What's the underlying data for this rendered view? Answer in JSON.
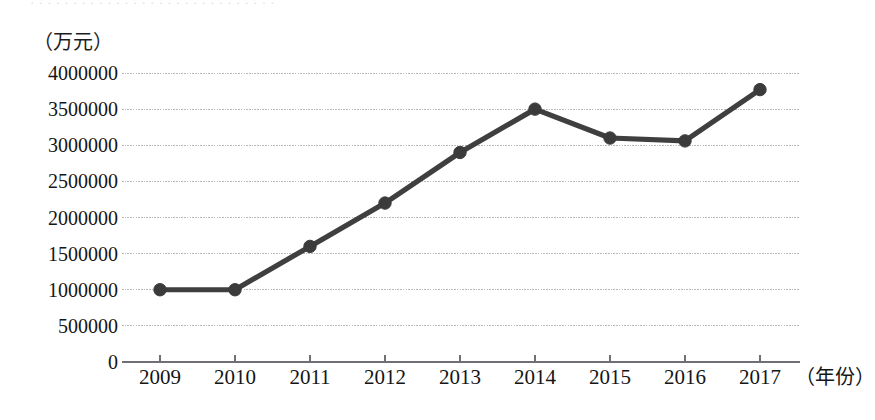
{
  "chart_data": {
    "type": "line",
    "title": "",
    "subtitle": "",
    "xlabel": "（年份）",
    "ylabel": "（万元）",
    "categories": [
      "2009",
      "2010",
      "2011",
      "2012",
      "2013",
      "2014",
      "2015",
      "2016",
      "2017"
    ],
    "x": [
      2009,
      2010,
      2011,
      2012,
      2013,
      2014,
      2015,
      2016,
      2017
    ],
    "values": [
      1000000,
      1000000,
      1600000,
      2200000,
      2900000,
      3500000,
      3100000,
      3060000,
      3770000
    ],
    "series": [
      {
        "name": "",
        "values": [
          1000000,
          1000000,
          1600000,
          2200000,
          2900000,
          3500000,
          3100000,
          3060000,
          3770000
        ]
      }
    ],
    "ylim": [
      0,
      4000000
    ],
    "ytick_labels": [
      "0",
      "500000",
      "1000000",
      "1500000",
      "2000000",
      "2500000",
      "3000000",
      "3500000",
      "4000000"
    ],
    "yticks": [
      0,
      500000,
      1000000,
      1500000,
      2000000,
      2500000,
      3000000,
      3500000,
      4000000
    ],
    "grid": true,
    "grid_axis": "y",
    "legend": false,
    "legend_position": "none",
    "marker": "circle",
    "line_color": "#3f3f3f",
    "marker_color": "#3b3b3b",
    "grid_color": "#b9b9bd",
    "axis_color": "#6f6f74",
    "background_color": "#ffffff",
    "annotations": []
  },
  "labels": {
    "y_unit": "（万元）",
    "x_unit": "（年份）",
    "top_sliver": "· ·   · · · ·   · · · · ·   · · ·   · ·   · · · ·   · ·   ·   · · ·   · ·   ·"
  },
  "y_ticks": [
    {
      "label": "4000000",
      "value": 4000000
    },
    {
      "label": "3500000",
      "value": 3500000
    },
    {
      "label": "3000000",
      "value": 3000000
    },
    {
      "label": "2500000",
      "value": 2500000
    },
    {
      "label": "2000000",
      "value": 2000000
    },
    {
      "label": "1500000",
      "value": 1500000
    },
    {
      "label": "1000000",
      "value": 1000000
    },
    {
      "label": "500000",
      "value": 500000
    },
    {
      "label": "0",
      "value": 0
    }
  ],
  "x_ticks": [
    {
      "label": "2009"
    },
    {
      "label": "2010"
    },
    {
      "label": "2011"
    },
    {
      "label": "2012"
    },
    {
      "label": "2013"
    },
    {
      "label": "2014"
    },
    {
      "label": "2015"
    },
    {
      "label": "2016"
    },
    {
      "label": "2017"
    }
  ]
}
